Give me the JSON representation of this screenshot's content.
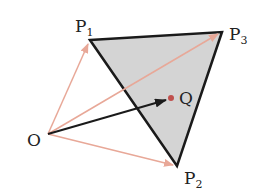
{
  "diagram": {
    "points": {
      "O": {
        "label": "O",
        "sub": ""
      },
      "P1": {
        "label": "P",
        "sub": "1"
      },
      "P2": {
        "label": "P",
        "sub": "2"
      },
      "P3": {
        "label": "P",
        "sub": "3"
      },
      "Q": {
        "label": "Q",
        "sub": ""
      }
    },
    "colors": {
      "triangle_fill": "#d4d4d4",
      "triangle_stroke": "#1a1a1a",
      "vector_light": "#e8a898",
      "vector_dark": "#1a1a1a",
      "q_dot": "#c0504d"
    },
    "vectors": [
      {
        "from": "O",
        "to": "P1",
        "style": "light"
      },
      {
        "from": "O",
        "to": "P2",
        "style": "light"
      },
      {
        "from": "O",
        "to": "P3",
        "style": "light"
      },
      {
        "from": "O",
        "to": "Q",
        "style": "dark"
      }
    ]
  }
}
